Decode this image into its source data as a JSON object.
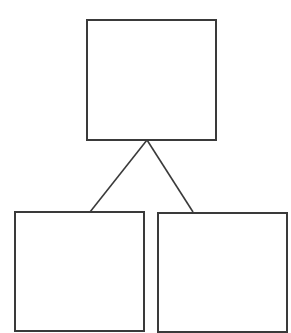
{
  "diagram": {
    "type": "tree",
    "stroke_color": "#3a3a3a",
    "background": "#ffffff",
    "nodes": [
      {
        "id": "root",
        "label": "",
        "x": 86,
        "y": 19,
        "w": 131,
        "h": 122
      },
      {
        "id": "left-child",
        "label": "",
        "x": 14,
        "y": 211,
        "w": 131,
        "h": 121
      },
      {
        "id": "right-child",
        "label": "",
        "x": 157,
        "y": 212,
        "w": 131,
        "h": 121
      }
    ],
    "edges": [
      {
        "from": "root",
        "to": "left-child",
        "x1": 147,
        "y1": 140,
        "x2": 90,
        "y2": 212
      },
      {
        "from": "root",
        "to": "right-child",
        "x1": 147,
        "y1": 140,
        "x2": 193,
        "y2": 212
      }
    ]
  }
}
